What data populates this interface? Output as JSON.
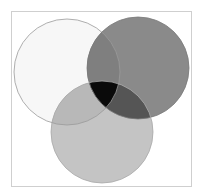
{
  "diagram": {
    "type": "venn",
    "frame": {
      "x": 11,
      "y": 11,
      "width": 180,
      "height": 175,
      "stroke": "#cfcfcf"
    },
    "circles": [
      {
        "name": "circle-top-left",
        "cx": 67,
        "cy": 72,
        "r": 53,
        "fill": "#f7f7f7",
        "stroke": "#9a9a9a"
      },
      {
        "name": "circle-top-right",
        "cx": 138,
        "cy": 68,
        "r": 51,
        "fill": "#8a8a8a",
        "stroke": "#7a7a7a"
      },
      {
        "name": "circle-bottom",
        "cx": 102,
        "cy": 132,
        "r": 51,
        "fill": "#c4c4c4",
        "stroke": "#a8a8a8"
      }
    ],
    "regions": {
      "top_left_only": "#f7f7f7",
      "top_right_only": "#8a8a8a",
      "bottom_only": "#c4c4c4",
      "top_left_and_top_right": "#7f7f7f",
      "top_left_and_bottom": "#b8b8b8",
      "top_right_and_bottom": "#555555",
      "all_three": "#0a0a0a"
    }
  }
}
